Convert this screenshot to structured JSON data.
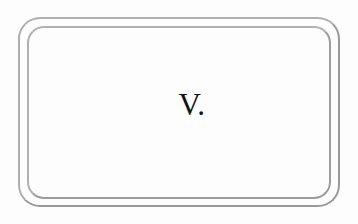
{
  "document": {
    "page_background_color": "#fdfdfd",
    "heading": {
      "text": "V.",
      "kind": "roman-numeral-section-number",
      "color": "#141414",
      "align": "center"
    },
    "frame": {
      "style": "double-ruled rounded rectangle",
      "line_color": "#a8a8a8",
      "line_count": 2,
      "corner": "rounded",
      "outer": {
        "x": 18,
        "y": 17,
        "width": 322,
        "height": 190,
        "radius": 22
      },
      "inner": {
        "x": 27,
        "y": 26,
        "width": 304,
        "height": 173,
        "radius": 17
      }
    }
  }
}
